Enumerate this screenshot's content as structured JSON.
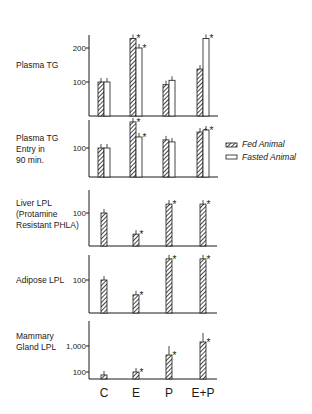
{
  "chart_data": [
    {
      "type": "bar",
      "title": "Plasma TG",
      "ylabel": "Plasma TG",
      "scale": "linear",
      "yticks": [
        100,
        200
      ],
      "ylim": [
        0,
        260
      ],
      "categories": [
        "C",
        "E",
        "P",
        "E+P"
      ],
      "series": [
        {
          "name": "Fed Animal",
          "values": [
            100,
            228,
            92,
            138
          ],
          "significant": [
            false,
            true,
            false,
            true
          ]
        },
        {
          "name": "Fasted Animal",
          "values": [
            100,
            200,
            105,
            228
          ],
          "significant": [
            false,
            true,
            false,
            true
          ]
        }
      ]
    },
    {
      "type": "bar",
      "title": "Plasma TG Entry in 90 min.",
      "ylabel": "Plasma TG Entry in 90 min.",
      "scale": "linear",
      "yticks": [
        100
      ],
      "ylim": [
        0,
        210
      ],
      "categories": [
        "C",
        "E",
        "P",
        "E+P"
      ],
      "series": [
        {
          "name": "Fed Animal",
          "values": [
            100,
            190,
            128,
            155
          ],
          "significant": [
            false,
            true,
            false,
            true
          ]
        },
        {
          "name": "Fasted Animal",
          "values": [
            100,
            138,
            121,
            162
          ],
          "significant": [
            false,
            true,
            false,
            true
          ]
        }
      ]
    },
    {
      "type": "bar",
      "title": "Liver LPL (Protamine Resistant PHLA)",
      "ylabel": "Liver LPL (Protamine Resistant PHLA)",
      "scale": "linear",
      "yticks": [
        100
      ],
      "ylim": [
        0,
        200
      ],
      "categories": [
        "C",
        "E",
        "P",
        "E+P"
      ],
      "series": [
        {
          "name": "Fed Animal",
          "values": [
            100,
            36,
            127,
            127
          ],
          "significant": [
            false,
            true,
            true,
            true
          ]
        }
      ]
    },
    {
      "type": "bar",
      "title": "Adipose LPL",
      "ylabel": "Adipose LPL",
      "scale": "linear",
      "yticks": [
        100
      ],
      "ylim": [
        0,
        200
      ],
      "categories": [
        "C",
        "E",
        "P",
        "E+P"
      ],
      "series": [
        {
          "name": "Fed Animal",
          "values": [
            100,
            55,
            164,
            164
          ],
          "significant": [
            false,
            true,
            true,
            true
          ]
        }
      ]
    },
    {
      "type": "bar",
      "title": "Mammary Gland LPL",
      "ylabel": "Mammary Gland LPL",
      "scale": "log",
      "yticks": [
        100,
        1000
      ],
      "ytick_labels": [
        "100",
        "1,000"
      ],
      "ylim": [
        60,
        5000
      ],
      "categories": [
        "C",
        "E",
        "P",
        "E+P"
      ],
      "series": [
        {
          "name": "Fed Animal",
          "values": [
            77,
            100,
            450,
            1430
          ],
          "significant": [
            false,
            true,
            true,
            true
          ]
        }
      ]
    }
  ],
  "legend": {
    "fed": "Fed Animal",
    "fasted": "Fasted Animal"
  },
  "panels": {
    "p1": {
      "label_lines": [
        "Plasma TG"
      ],
      "ticks": [
        "200",
        "100"
      ]
    },
    "p2": {
      "label_lines": [
        "Plasma TG",
        "Entry in",
        "90 min."
      ],
      "ticks": [
        "100"
      ]
    },
    "p3": {
      "label_lines": [
        "Liver LPL",
        "(Protamine",
        "Resistant PHLA)"
      ],
      "ticks": [
        "100"
      ]
    },
    "p4": {
      "label_lines": [
        "Adipose LPL"
      ],
      "ticks": [
        "100"
      ]
    },
    "p5": {
      "label_lines": [
        "Mammary",
        "Gland LPL"
      ],
      "ticks": [
        "1,000",
        "100"
      ]
    }
  },
  "categories": [
    "C",
    "E",
    "P",
    "E+P"
  ],
  "significance_marker": "*"
}
